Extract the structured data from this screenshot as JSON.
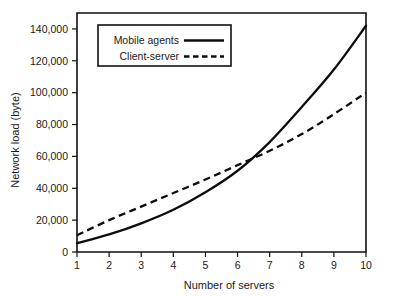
{
  "chart_data": {
    "type": "line",
    "title": "",
    "xlabel": "Number of servers",
    "ylabel": "Network load (byte)",
    "xlim": [
      1,
      10
    ],
    "ylim": [
      0,
      150000
    ],
    "grid": false,
    "legend_position": "upper left inside plot",
    "x": [
      1,
      2,
      3,
      4,
      5,
      6,
      7,
      8,
      9,
      10
    ],
    "xticks": [
      "1",
      "2",
      "3",
      "4",
      "5",
      "6",
      "7",
      "8",
      "9",
      "10"
    ],
    "yticks": [
      "0",
      "20,000",
      "40,000",
      "60,000",
      "80,000",
      "100,000",
      "120,000",
      "140,000"
    ],
    "ytick_values": [
      0,
      20000,
      40000,
      60000,
      80000,
      100000,
      120000,
      140000
    ],
    "series": [
      {
        "name": "Mobile agents",
        "style": "solid",
        "color": "#0d0d0d",
        "values": [
          5500,
          11000,
          18000,
          26500,
          37500,
          51000,
          69000,
          91000,
          114500,
          142000
        ]
      },
      {
        "name": "Client-server",
        "style": "dashed",
        "color": "#0d0d0d",
        "values": [
          10500,
          20000,
          28500,
          37000,
          45500,
          54500,
          63500,
          74000,
          86500,
          100000
        ]
      }
    ]
  },
  "legend": {
    "entries": [
      {
        "label": "Mobile agents",
        "style": "solid"
      },
      {
        "label": "Client-server",
        "style": "dashed"
      }
    ]
  }
}
